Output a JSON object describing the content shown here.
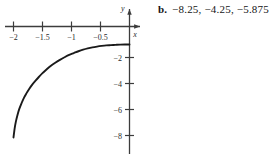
{
  "answer": {
    "label": "b.",
    "values": "−8.25, −4.25, −5.875"
  },
  "chart_data": {
    "type": "line",
    "title": "",
    "xlabel": "x",
    "ylabel": "y",
    "xlim": [
      -2.15,
      0.18
    ],
    "ylim": [
      -8.9,
      0.55
    ],
    "grid": false,
    "legend": null,
    "x_ticks": [
      -2,
      -1.5,
      -1,
      -0.5
    ],
    "x_tick_labels": [
      "−2",
      "−1.5",
      "−1",
      "−0.5"
    ],
    "y_ticks": [
      -2,
      -4,
      -6,
      -8
    ],
    "y_tick_labels": [
      "−2",
      "−4",
      "−6",
      "−8"
    ],
    "series": [
      {
        "name": "curve",
        "x": [
          -2.0,
          -1.98,
          -1.96,
          -1.93,
          -1.9,
          -1.86,
          -1.82,
          -1.78,
          -1.73,
          -1.68,
          -1.62,
          -1.56,
          -1.5,
          -1.43,
          -1.36,
          -1.28,
          -1.2,
          -1.12,
          -1.04,
          -0.96,
          -0.88,
          -0.8,
          -0.72,
          -0.64,
          -0.56,
          -0.48,
          -0.4,
          -0.32,
          -0.24,
          -0.16,
          -0.08,
          0.0
        ],
        "y": [
          -8.15,
          -7.45,
          -6.95,
          -6.4,
          -5.95,
          -5.5,
          -5.1,
          -4.78,
          -4.42,
          -4.1,
          -3.78,
          -3.48,
          -3.2,
          -2.92,
          -2.65,
          -2.4,
          -2.18,
          -1.98,
          -1.8,
          -1.66,
          -1.52,
          -1.4,
          -1.3,
          -1.22,
          -1.16,
          -1.11,
          -1.07,
          -1.05,
          -1.03,
          -1.01,
          -1.0,
          -1.0
        ]
      }
    ]
  },
  "colors": {
    "curve": "#1a1a1a",
    "axis": "#3c3c3c",
    "text": "#141414"
  }
}
